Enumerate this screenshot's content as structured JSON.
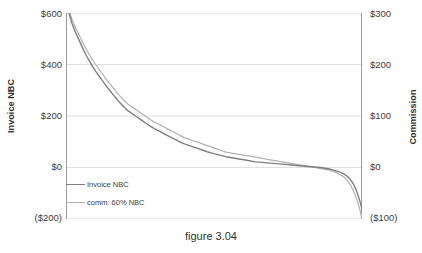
{
  "caption": "figure 3.04",
  "axes": {
    "left_title": "Invoice NBC",
    "right_title": "Commission",
    "left_ticks": [
      "$600",
      "$400",
      "$200",
      "$0",
      "($200)"
    ],
    "right_ticks": [
      "$300",
      "$200",
      "$100",
      "$0",
      "($100)"
    ]
  },
  "legend": {
    "items": [
      {
        "label": "Invoice NBC",
        "color": "#7f7f7f"
      },
      {
        "label": "comm: 60% NBC",
        "color": "#b2b2b2"
      }
    ]
  },
  "chart_data": {
    "type": "line",
    "title": "figure 3.04",
    "xlabel": "",
    "ylabel": "Invoice NBC",
    "y2label": "Commission",
    "ylim": [
      -200,
      600
    ],
    "y2lim": [
      -100,
      300
    ],
    "yticks": [
      600,
      400,
      200,
      0,
      -200
    ],
    "y2ticks": [
      300,
      200,
      100,
      0,
      -100
    ],
    "ytick_labels": [
      "$600",
      "$400",
      "$200",
      "$0",
      "($200)"
    ],
    "y2tick_labels": [
      "$300",
      "$200",
      "$100",
      "$0",
      "($100)"
    ],
    "grid": true,
    "xaxis_ticks_visible": false,
    "legend_position": "inside-lower-left",
    "series": [
      {
        "name": "Invoice NBC",
        "color": "#7f7f7f",
        "axis": "left",
        "x": [
          0,
          1,
          2,
          3,
          4,
          5,
          6,
          7,
          8,
          9,
          10,
          11,
          12,
          13,
          14,
          15,
          16,
          17,
          18,
          19,
          20,
          21,
          22,
          23,
          24,
          25,
          26,
          27,
          28,
          29,
          30,
          31,
          32,
          33,
          34,
          35,
          36,
          37,
          38,
          39,
          40,
          41,
          42,
          43,
          44,
          45,
          46,
          47,
          48,
          49,
          50,
          51,
          52,
          53,
          54,
          55,
          56,
          57,
          58,
          59,
          60,
          61,
          62,
          63,
          64,
          65,
          66,
          67,
          68,
          69,
          70,
          71,
          72,
          73,
          74,
          75,
          76,
          77,
          78,
          79,
          80,
          81,
          82,
          83,
          84,
          85,
          86,
          87,
          88,
          89,
          90,
          91,
          92,
          93,
          94,
          95,
          96,
          97,
          98,
          99,
          100
        ],
        "values": [
          640,
          600,
          560,
          530,
          505,
          480,
          455,
          432,
          412,
          392,
          374,
          358,
          342,
          326,
          310,
          296,
          282,
          268,
          254,
          242,
          230,
          220,
          212,
          204,
          196,
          188,
          180,
          172,
          164,
          157,
          150,
          144,
          138,
          132,
          126,
          120,
          114,
          108,
          102,
          97,
          92,
          88,
          84,
          80,
          76,
          72,
          68,
          64,
          60,
          57,
          54,
          51,
          48,
          45,
          42,
          40,
          38,
          36,
          34,
          32,
          30,
          28,
          26,
          24,
          22,
          21,
          20,
          19,
          18,
          17,
          16,
          15,
          14,
          13,
          12,
          11,
          10,
          9,
          8,
          7,
          6,
          5,
          4,
          3,
          2,
          1,
          0,
          -2,
          -4,
          -6,
          -9,
          -12,
          -16,
          -20,
          -26,
          -34,
          -46,
          -62,
          -86,
          -120,
          -160
        ]
      },
      {
        "name": "comm: 60% NBC",
        "color": "#b2b2b2",
        "axis": "right",
        "x": [
          0,
          1,
          2,
          3,
          4,
          5,
          6,
          7,
          8,
          9,
          10,
          11,
          12,
          13,
          14,
          15,
          16,
          17,
          18,
          19,
          20,
          21,
          22,
          23,
          24,
          25,
          26,
          27,
          28,
          29,
          30,
          31,
          32,
          33,
          34,
          35,
          36,
          37,
          38,
          39,
          40,
          41,
          42,
          43,
          44,
          45,
          46,
          47,
          48,
          49,
          50,
          51,
          52,
          53,
          54,
          55,
          56,
          57,
          58,
          59,
          60,
          61,
          62,
          63,
          64,
          65,
          66,
          67,
          68,
          69,
          70,
          71,
          72,
          73,
          74,
          75,
          76,
          77,
          78,
          79,
          80,
          81,
          82,
          83,
          84,
          85,
          86,
          87,
          88,
          89,
          90,
          91,
          92,
          93,
          94,
          95,
          96,
          97,
          98,
          99,
          100
        ],
        "values": [
          324,
          306,
          288,
          274,
          262,
          250,
          239,
          228,
          218,
          209,
          200,
          192,
          184,
          176,
          168,
          161,
          154,
          147,
          140,
          134,
          128,
          123,
          119,
          115,
          111,
          107,
          103,
          99,
          95,
          91,
          88,
          85,
          82,
          79,
          76,
          73,
          70,
          67,
          64,
          61,
          58,
          56,
          54,
          52,
          50,
          48,
          46,
          44,
          42,
          40,
          38,
          36,
          34,
          32,
          30,
          29,
          28,
          27,
          26,
          25,
          24,
          23,
          22,
          21,
          20,
          19,
          18,
          17,
          16,
          15,
          14,
          13,
          12,
          11,
          10,
          9,
          8,
          7,
          6,
          5,
          4,
          3,
          2,
          1,
          0,
          -1,
          -2,
          -3,
          -4,
          -5,
          -7,
          -9,
          -12,
          -15,
          -19,
          -25,
          -33,
          -44,
          -58,
          -76,
          -98
        ]
      }
    ]
  }
}
